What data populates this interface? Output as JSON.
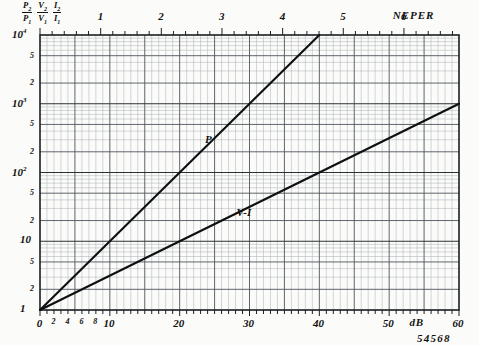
{
  "figure": {
    "stamp": "54568",
    "background_color": "#fbfbf9",
    "ink_color": "#111111"
  },
  "y_axis": {
    "heading_fractions": [
      {
        "num": "P",
        "num_sub": "2",
        "den": "P",
        "den_sub": "1"
      },
      {
        "num": "V",
        "num_sub": "2",
        "den": "V",
        "den_sub": "1"
      },
      {
        "num": "I",
        "num_sub": "2",
        "den": "I",
        "den_sub": "1"
      }
    ],
    "scale": "log",
    "min": 1,
    "max": 10000,
    "tick_labels": [
      "1",
      "2",
      "5",
      "10",
      "2",
      "5",
      "10²",
      "2",
      "5",
      "10³",
      "2",
      "5",
      "10⁴"
    ],
    "decade_labels": [
      "1",
      "10",
      "10²",
      "10³",
      "10⁴"
    ],
    "minor_labels": [
      "2",
      "5"
    ]
  },
  "x_axis_bottom": {
    "unit": "dB",
    "min": 0,
    "max": 60,
    "major_labels": [
      "0",
      "10",
      "20",
      "30",
      "40",
      "50",
      "60"
    ],
    "minor_labels": [
      "2",
      "4",
      "6",
      "8"
    ],
    "tick_step": 1
  },
  "x_axis_top": {
    "unit": "NEPER",
    "min": 0,
    "max": 6.9,
    "labels": [
      "1",
      "2",
      "3",
      "4",
      "5",
      "6"
    ],
    "db_per_neper": 8.686
  },
  "curves": [
    {
      "name": "P",
      "label": "P",
      "label_x_db": 24.5,
      "label_y_ratio": 300,
      "formula": "10^(dB/10)",
      "points_db_ratio": [
        [
          0,
          1
        ],
        [
          10,
          10
        ],
        [
          20,
          100
        ],
        [
          30,
          1000
        ],
        [
          40,
          10000
        ]
      ]
    },
    {
      "name": "V-I",
      "label": "V-I",
      "label_x_db": 29,
      "label_y_ratio": 26,
      "formula": "10^(dB/20)",
      "points_db_ratio": [
        [
          0,
          1
        ],
        [
          20,
          10
        ],
        [
          40,
          100
        ],
        [
          60,
          1000
        ]
      ]
    }
  ],
  "chart_data": {
    "type": "line",
    "title": "",
    "xlabel": "dB",
    "ylabel": "P2/P1  V2/V1  I2/I1",
    "xlim": [
      0,
      60
    ],
    "ylim": [
      1,
      10000
    ],
    "yscale": "log",
    "grid": true,
    "secondary_xaxis": {
      "label": "NEPER",
      "lim": [
        0,
        6.9
      ]
    },
    "legend": "inline-annotations",
    "series": [
      {
        "name": "P",
        "x": [
          0,
          5,
          10,
          15,
          20,
          25,
          30,
          35,
          40
        ],
        "values": [
          1,
          3.162,
          10,
          31.62,
          100,
          316.2,
          1000,
          3162,
          10000
        ]
      },
      {
        "name": "V-I",
        "x": [
          0,
          10,
          20,
          30,
          40,
          50,
          60
        ],
        "values": [
          1,
          3.162,
          10,
          31.62,
          100,
          316.2,
          1000
        ]
      }
    ],
    "annotations": [
      {
        "text": "P",
        "x": 24.5,
        "y": 300
      },
      {
        "text": "V-I",
        "x": 29,
        "y": 26
      },
      {
        "text": "54568",
        "x": 52,
        "y": 0.55
      }
    ]
  }
}
